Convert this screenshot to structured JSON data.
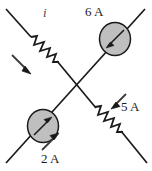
{
  "figure": {
    "name": "crossed-branch-circuit",
    "type": "circuit-diagram",
    "background_color": "#ffffff",
    "line_color": "#1a1a1a",
    "source_fill_color": "#bfbfbf",
    "labels": {
      "current_i": "i",
      "current_6a": "6 A",
      "current_5a": "5 A",
      "current_2a": "2 A"
    },
    "elements": {
      "resistor_upper_left": "resistor-zigzag",
      "resistor_lower_right": "resistor-zigzag",
      "source_upper_right": "current-source-circle",
      "source_lower_left": "current-source-circle",
      "arrow_upper_left": "current-direction-arrow",
      "arrow_5a": "current-direction-arrow",
      "arrow_2a": "current-direction-arrow",
      "branch_nw_se": "wire-diagonal",
      "branch_sw_ne": "wire-diagonal"
    }
  }
}
